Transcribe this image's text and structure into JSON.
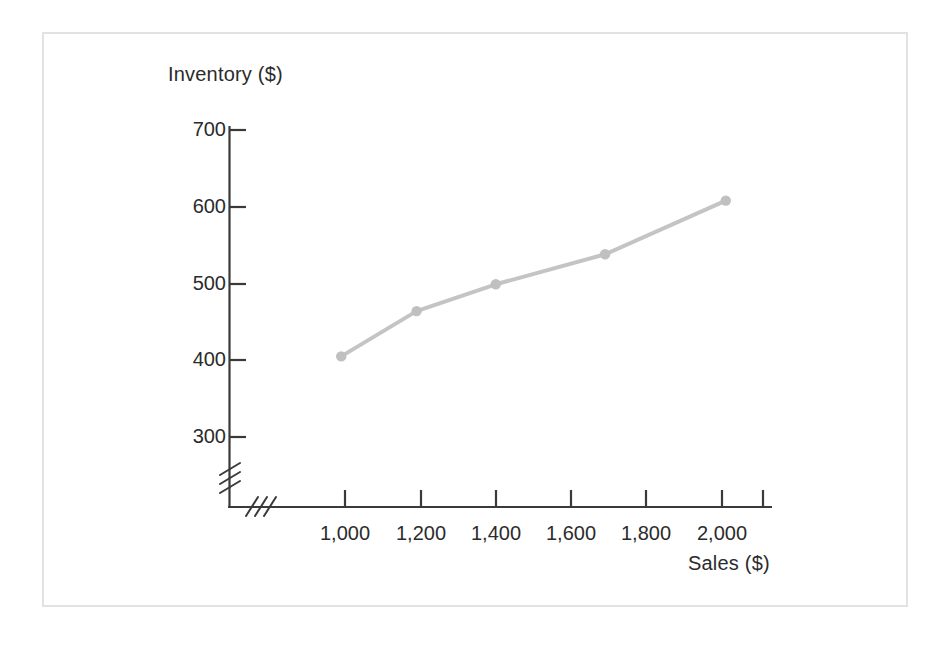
{
  "figure": {
    "background_color": "#ffffff",
    "frame_color": "#e2e2e2"
  },
  "chart_data": {
    "type": "line",
    "title": "",
    "subtitle": "",
    "xlabel": "Sales ($)",
    "ylabel": "Inventory ($)",
    "x": [
      990,
      1190,
      1400,
      1690,
      2010
    ],
    "values": [
      405,
      464,
      499,
      538,
      608
    ],
    "series": [
      {
        "name": "Inventory",
        "x": [
          990,
          1190,
          1400,
          1690,
          2010
        ],
        "values": [
          405,
          464,
          499,
          538,
          608
        ],
        "line_color": "#c4c4c4",
        "marker_color": "#c0c0c0",
        "marker": "circle"
      }
    ],
    "xlim": [
      900,
      2200
    ],
    "ylim": [
      260,
      730
    ],
    "xticks": [
      1000,
      1200,
      1400,
      1600,
      1800,
      2000,
      2200
    ],
    "xtick_labels": [
      "1,000",
      "1,200",
      "1,400",
      "1,600",
      "1,800",
      "2,000",
      ""
    ],
    "yticks": [
      300,
      400,
      500,
      600,
      700
    ],
    "ytick_labels": [
      "300",
      "400",
      "500",
      "600",
      "700"
    ],
    "grid": false,
    "legend": null,
    "axis_break": {
      "x_axis": true,
      "y_axis": true,
      "symbol": "double-slash"
    },
    "annotations": []
  },
  "axes": {
    "y_title": "Inventory ($)",
    "x_title": "Sales ($)",
    "axis_color": "#3a3a3a",
    "tick_text_color": "#2b2b2b",
    "y_labels": [
      "700",
      "600",
      "500",
      "400",
      "300"
    ],
    "x_labels": [
      "1,000",
      "1,200",
      "1,400",
      "1,600",
      "1,800",
      "2,000"
    ]
  }
}
